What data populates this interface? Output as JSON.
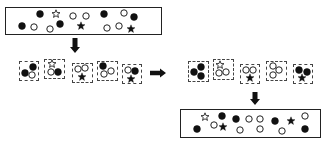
{
  "diagram": {
    "colors": {
      "stroke": "#222222",
      "fill_dark": "#111111",
      "background": "#ffffff"
    },
    "legend_shapes": [
      "filled-circle",
      "hollow-circle",
      "filled-star",
      "hollow-star"
    ],
    "top_box": {
      "items": [
        {
          "shape": "filled-circle",
          "x": 40,
          "y": 14
        },
        {
          "shape": "hollow-star",
          "x": 56,
          "y": 14
        },
        {
          "shape": "hollow-circle",
          "x": 73,
          "y": 16
        },
        {
          "shape": "hollow-circle",
          "x": 86,
          "y": 16
        },
        {
          "shape": "filled-circle",
          "x": 104,
          "y": 14
        },
        {
          "shape": "hollow-circle",
          "x": 124,
          "y": 13
        },
        {
          "shape": "filled-circle",
          "x": 134,
          "y": 17
        },
        {
          "shape": "filled-circle",
          "x": 22,
          "y": 26
        },
        {
          "shape": "hollow-circle",
          "x": 34,
          "y": 27
        },
        {
          "shape": "hollow-circle",
          "x": 50,
          "y": 29
        },
        {
          "shape": "filled-circle",
          "x": 60,
          "y": 24
        },
        {
          "shape": "filled-star",
          "x": 81,
          "y": 26
        },
        {
          "shape": "hollow-circle",
          "x": 107,
          "y": 28
        },
        {
          "shape": "hollow-circle",
          "x": 119,
          "y": 26
        },
        {
          "shape": "filled-star",
          "x": 131,
          "y": 29
        }
      ]
    },
    "groups_initial": [
      {
        "x": 19,
        "y": 61,
        "w": 20,
        "h": 20,
        "items": [
          {
            "shape": "filled-circle",
            "dx": 14,
            "dy": 6
          },
          {
            "shape": "filled-circle",
            "dx": 6,
            "dy": 12
          },
          {
            "shape": "hollow-circle",
            "dx": 13,
            "dy": 14
          }
        ]
      },
      {
        "x": 44,
        "y": 59,
        "w": 21,
        "h": 20,
        "items": [
          {
            "shape": "hollow-star",
            "dx": 8,
            "dy": 5
          },
          {
            "shape": "hollow-circle",
            "dx": 7,
            "dy": 13
          },
          {
            "shape": "filled-circle",
            "dx": 14,
            "dy": 13
          }
        ]
      },
      {
        "x": 72,
        "y": 63,
        "w": 21,
        "h": 20,
        "items": [
          {
            "shape": "hollow-circle",
            "dx": 6,
            "dy": 6
          },
          {
            "shape": "hollow-circle",
            "dx": 13,
            "dy": 5
          },
          {
            "shape": "filled-star",
            "dx": 10,
            "dy": 14
          }
        ]
      },
      {
        "x": 97,
        "y": 61,
        "w": 21,
        "h": 20,
        "items": [
          {
            "shape": "filled-circle",
            "dx": 6,
            "dy": 5
          },
          {
            "shape": "hollow-circle",
            "dx": 14,
            "dy": 10
          },
          {
            "shape": "hollow-circle",
            "dx": 7,
            "dy": 13
          }
        ]
      },
      {
        "x": 122,
        "y": 64,
        "w": 20,
        "h": 20,
        "items": [
          {
            "shape": "hollow-circle",
            "dx": 6,
            "dy": 6
          },
          {
            "shape": "filled-circle",
            "dx": 13,
            "dy": 7
          },
          {
            "shape": "filled-star",
            "dx": 9,
            "dy": 15
          }
        ]
      }
    ],
    "groups_reordered": [
      {
        "x": 188,
        "y": 61,
        "w": 21,
        "h": 21,
        "items": [
          {
            "shape": "filled-circle",
            "dx": 13,
            "dy": 6
          },
          {
            "shape": "filled-circle",
            "dx": 6,
            "dy": 11
          },
          {
            "shape": "filled-circle",
            "dx": 13,
            "dy": 15
          }
        ]
      },
      {
        "x": 213,
        "y": 59,
        "w": 21,
        "h": 21,
        "items": [
          {
            "shape": "hollow-star",
            "dx": 7,
            "dy": 6
          },
          {
            "shape": "hollow-circle",
            "dx": 6,
            "dy": 14
          },
          {
            "shape": "hollow-circle",
            "dx": 13,
            "dy": 13
          }
        ]
      },
      {
        "x": 240,
        "y": 64,
        "w": 20,
        "h": 20,
        "items": [
          {
            "shape": "hollow-circle",
            "dx": 6,
            "dy": 6
          },
          {
            "shape": "hollow-circle",
            "dx": 13,
            "dy": 6
          },
          {
            "shape": "filled-star",
            "dx": 10,
            "dy": 14
          }
        ]
      },
      {
        "x": 266,
        "y": 61,
        "w": 21,
        "h": 20,
        "items": [
          {
            "shape": "hollow-circle",
            "dx": 7,
            "dy": 5
          },
          {
            "shape": "hollow-circle",
            "dx": 13,
            "dy": 9
          },
          {
            "shape": "hollow-circle",
            "dx": 7,
            "dy": 14
          }
        ]
      },
      {
        "x": 293,
        "y": 64,
        "w": 20,
        "h": 20,
        "items": [
          {
            "shape": "filled-circle",
            "dx": 6,
            "dy": 6
          },
          {
            "shape": "filled-circle",
            "dx": 14,
            "dy": 8
          },
          {
            "shape": "filled-star",
            "dx": 9,
            "dy": 14
          }
        ]
      }
    ],
    "bottom_box": {
      "items": [
        {
          "shape": "filled-circle",
          "x": 197,
          "y": 129
        },
        {
          "shape": "hollow-star",
          "x": 205,
          "y": 117
        },
        {
          "shape": "hollow-circle",
          "x": 214,
          "y": 125
        },
        {
          "shape": "filled-star",
          "x": 223,
          "y": 127
        },
        {
          "shape": "filled-circle",
          "x": 222,
          "y": 116
        },
        {
          "shape": "filled-circle",
          "x": 236,
          "y": 119
        },
        {
          "shape": "hollow-circle",
          "x": 240,
          "y": 130
        },
        {
          "shape": "hollow-circle",
          "x": 249,
          "y": 119
        },
        {
          "shape": "hollow-circle",
          "x": 260,
          "y": 119
        },
        {
          "shape": "hollow-circle",
          "x": 260,
          "y": 129
        },
        {
          "shape": "filled-circle",
          "x": 275,
          "y": 121
        },
        {
          "shape": "hollow-circle",
          "x": 282,
          "y": 131
        },
        {
          "shape": "filled-star",
          "x": 291,
          "y": 121
        },
        {
          "shape": "hollow-circle",
          "x": 305,
          "y": 116
        },
        {
          "shape": "filled-circle",
          "x": 305,
          "y": 129
        }
      ]
    },
    "arrows": [
      {
        "direction": "down",
        "x": 75,
        "y1": 38,
        "y2": 53
      },
      {
        "direction": "right",
        "y": 73,
        "x1": 150,
        "x2": 166
      },
      {
        "direction": "down",
        "x": 255,
        "y1": 92,
        "y2": 105
      }
    ]
  }
}
